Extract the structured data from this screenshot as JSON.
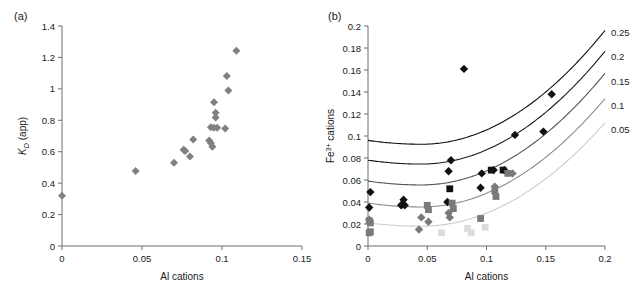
{
  "figure": {
    "panel_a_label": "(a)",
    "panel_b_label": "(b)"
  },
  "chart_data": [
    {
      "id": "panel_a",
      "type": "scatter",
      "title": "(a)",
      "xlabel": "Al cations",
      "ylabel": "K_D (app)",
      "ylabel_parts": {
        "italic": "K",
        "subscript": "D",
        "rest": " (app)"
      },
      "xlim": [
        0,
        0.15
      ],
      "ylim": [
        0,
        1.4
      ],
      "xticks": [
        0,
        0.05,
        0.1,
        0.15
      ],
      "xticklabels": [
        "0",
        "0.05",
        "0.1",
        "0.15"
      ],
      "yticks": [
        0,
        0.2,
        0.4,
        0.6,
        0.8,
        1.0,
        1.2,
        1.4
      ],
      "yticklabels": [
        "0",
        "0.2",
        "0.4",
        "0.6",
        "0.8",
        "1",
        "1.2",
        "1.4"
      ],
      "grid": false,
      "legend": "none",
      "series": [
        {
          "name": "KD app",
          "marker": "diamond",
          "color": "#808080",
          "points": [
            [
              0.0,
              0.32
            ],
            [
              0.046,
              0.478
            ],
            [
              0.07,
              0.53
            ],
            [
              0.076,
              0.612
            ],
            [
              0.077,
              0.605
            ],
            [
              0.08,
              0.57
            ],
            [
              0.082,
              0.678
            ],
            [
              0.092,
              0.672
            ],
            [
              0.093,
              0.655
            ],
            [
              0.094,
              0.632
            ],
            [
              0.093,
              0.755
            ],
            [
              0.095,
              0.752
            ],
            [
              0.097,
              0.752
            ],
            [
              0.102,
              0.748
            ],
            [
              0.095,
              0.915
            ],
            [
              0.096,
              0.848
            ],
            [
              0.096,
              0.818
            ],
            [
              0.103,
              1.082
            ],
            [
              0.104,
              0.99
            ],
            [
              0.109,
              1.243
            ]
          ]
        }
      ]
    },
    {
      "id": "panel_b",
      "type": "scatter",
      "title": "(b)",
      "xlabel": "Al cations",
      "ylabel": "Fe3+ cations",
      "ylabel_parts": {
        "base": "Fe",
        "superscript": "3+",
        "rest": " cations"
      },
      "xlim": [
        0,
        0.2
      ],
      "ylim": [
        0,
        0.2
      ],
      "xticks": [
        0,
        0.05,
        0.1,
        0.15,
        0.2
      ],
      "xticklabels": [
        "0",
        "0.05",
        "0.1",
        "0.15",
        "0.2"
      ],
      "yticks": [
        0,
        0.02,
        0.04,
        0.06,
        0.08,
        0.1,
        0.12,
        0.14,
        0.16,
        0.18,
        0.2
      ],
      "yticklabels": [
        "0",
        "0.02",
        "0.04",
        "0.06",
        "0.08",
        "0.1",
        "0.12",
        "0.14",
        "0.16",
        "0.18",
        "0.2"
      ],
      "grid": false,
      "legend": "curve-end-labels",
      "curves": [
        {
          "label": "0.25",
          "color": "#111111",
          "y0": 0.096,
          "ymin": 0.0925,
          "xmin": 0.045,
          "y_at_xmax": 0.196,
          "label_y": 0.194
        },
        {
          "label": "0.2",
          "color": "#1d1d1d",
          "y0": 0.078,
          "ymin": 0.0745,
          "xmin": 0.045,
          "y_at_xmax": 0.177,
          "label_y": 0.172
        },
        {
          "label": "0.15",
          "color": "#555555",
          "y0": 0.059,
          "ymin": 0.0555,
          "xmin": 0.045,
          "y_at_xmax": 0.157,
          "label_y": 0.15
        },
        {
          "label": "0.1",
          "color": "#8c8c8c",
          "y0": 0.039,
          "ymin": 0.0355,
          "xmin": 0.045,
          "y_at_xmax": 0.134,
          "label_y": 0.128
        },
        {
          "label": "0.05",
          "color": "#cdcdcd",
          "y0": 0.021,
          "ymin": 0.018,
          "xmin": 0.045,
          "y_at_xmax": 0.112,
          "label_y": 0.106
        }
      ],
      "series": [
        {
          "name": "black diamonds",
          "marker": "diamond",
          "color": "#111111",
          "points": [
            [
              0.001,
              0.035
            ],
            [
              0.002,
              0.049
            ],
            [
              0.028,
              0.037
            ],
            [
              0.029,
              0.038
            ],
            [
              0.03,
              0.042
            ],
            [
              0.031,
              0.037
            ],
            [
              0.067,
              0.04
            ],
            [
              0.068,
              0.068
            ],
            [
              0.07,
              0.078
            ],
            [
              0.081,
              0.161
            ],
            [
              0.095,
              0.053
            ],
            [
              0.096,
              0.066
            ],
            [
              0.106,
              0.069
            ],
            [
              0.115,
              0.069
            ],
            [
              0.124,
              0.101
            ],
            [
              0.148,
              0.104
            ],
            [
              0.155,
              0.138
            ]
          ]
        },
        {
          "name": "black squares",
          "marker": "square",
          "color": "#111111",
          "points": [
            [
              0.069,
              0.052
            ],
            [
              0.104,
              0.069
            ],
            [
              0.114,
              0.069
            ]
          ]
        },
        {
          "name": "dark gray squares",
          "marker": "square",
          "color": "#7a7a7a",
          "points": [
            [
              0.001,
              0.023
            ],
            [
              0.002,
              0.021
            ],
            [
              0.001,
              0.012
            ],
            [
              0.002,
              0.013
            ],
            [
              0.05,
              0.037
            ],
            [
              0.051,
              0.033
            ],
            [
              0.071,
              0.039
            ],
            [
              0.072,
              0.034
            ],
            [
              0.095,
              0.025
            ],
            [
              0.107,
              0.05
            ],
            [
              0.108,
              0.045
            ],
            [
              0.118,
              0.066
            ]
          ]
        },
        {
          "name": "dark gray diamonds",
          "marker": "diamond",
          "color": "#7a7a7a",
          "points": [
            [
              0.001,
              0.024
            ],
            [
              0.043,
              0.015
            ],
            [
              0.045,
              0.026
            ],
            [
              0.051,
              0.022
            ],
            [
              0.068,
              0.03
            ],
            [
              0.069,
              0.026
            ],
            [
              0.107,
              0.054
            ],
            [
              0.122,
              0.066
            ]
          ]
        },
        {
          "name": "light gray markers",
          "marker": "square",
          "color": "#dcdcdc",
          "points": [
            [
              0.084,
              0.016
            ],
            [
              0.087,
              0.012
            ],
            [
              0.099,
              0.017
            ],
            [
              0.062,
              0.012
            ]
          ]
        }
      ]
    }
  ]
}
